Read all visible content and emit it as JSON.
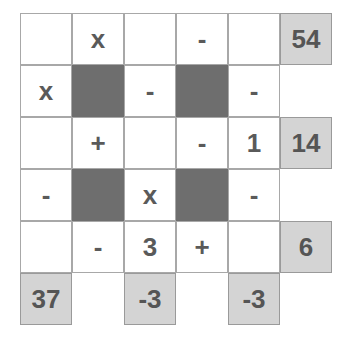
{
  "puzzle": {
    "type": "arithmetic-crossmath-grid",
    "rows": 6,
    "cols": 6,
    "cell_size_px": 52,
    "colors": {
      "page_background": "#ffffff",
      "cell_background": "#ffffff",
      "cell_border": "#a8a8a8",
      "blocked_cell": "#6e6e6e",
      "result_cell_background": "#d4d4d4",
      "result_cell_border": "#9a9a9a",
      "text": "#5a5a5a"
    },
    "grid": [
      [
        {
          "text": "",
          "kind": "play"
        },
        {
          "text": "x",
          "kind": "play"
        },
        {
          "text": "",
          "kind": "play"
        },
        {
          "text": "-",
          "kind": "play"
        },
        {
          "text": "",
          "kind": "play"
        },
        {
          "text": "54",
          "kind": "result"
        }
      ],
      [
        {
          "text": "x",
          "kind": "play"
        },
        {
          "text": "",
          "kind": "block"
        },
        {
          "text": "-",
          "kind": "play"
        },
        {
          "text": "",
          "kind": "block"
        },
        {
          "text": "-",
          "kind": "play"
        },
        {
          "text": "",
          "kind": "empty"
        }
      ],
      [
        {
          "text": "",
          "kind": "play"
        },
        {
          "text": "+",
          "kind": "play"
        },
        {
          "text": "",
          "kind": "play"
        },
        {
          "text": "-",
          "kind": "play"
        },
        {
          "text": "1",
          "kind": "play"
        },
        {
          "text": "14",
          "kind": "result"
        }
      ],
      [
        {
          "text": "-",
          "kind": "play"
        },
        {
          "text": "",
          "kind": "block"
        },
        {
          "text": "x",
          "kind": "play"
        },
        {
          "text": "",
          "kind": "block"
        },
        {
          "text": "-",
          "kind": "play"
        },
        {
          "text": "",
          "kind": "empty"
        }
      ],
      [
        {
          "text": "",
          "kind": "play"
        },
        {
          "text": "-",
          "kind": "play"
        },
        {
          "text": "3",
          "kind": "play"
        },
        {
          "text": "+",
          "kind": "play"
        },
        {
          "text": "",
          "kind": "play"
        },
        {
          "text": "6",
          "kind": "result"
        }
      ],
      [
        {
          "text": "37",
          "kind": "result"
        },
        {
          "text": "",
          "kind": "empty"
        },
        {
          "text": "-3",
          "kind": "result"
        },
        {
          "text": "",
          "kind": "empty"
        },
        {
          "text": "-3",
          "kind": "result"
        },
        {
          "text": "",
          "kind": "empty"
        }
      ]
    ]
  }
}
